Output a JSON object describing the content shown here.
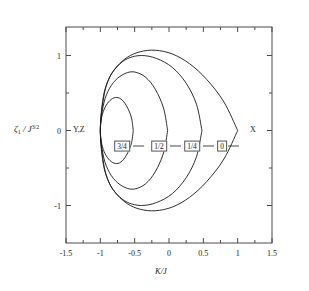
{
  "figure": {
    "background": "#ffffff",
    "axis_color": "#4d4d4d",
    "curve_color": "#1a1a1a"
  },
  "axes": {
    "x_title": "K/J",
    "y_title_zeta": "ζ",
    "y_title_sub": "1",
    "y_title_mid": " / J",
    "y_title_sup": "3/2",
    "x_ticks": [
      "-1.5",
      "-1",
      "-0.5",
      "0",
      "0.5",
      "1",
      "1.5"
    ],
    "x_tick_values": [
      -1.5,
      -1,
      -0.5,
      0,
      0.5,
      1,
      1.5
    ],
    "y_ticks": [
      "1",
      "0",
      "-1"
    ],
    "y_tick_values": [
      1,
      0,
      -1
    ],
    "x_minor_values": [
      -1.25,
      -0.75,
      -0.25,
      0.25,
      0.75,
      1.25
    ],
    "y_minor_values": [
      0.5,
      -0.5
    ],
    "xlim": [
      -1.5,
      1.5
    ],
    "ylim": [
      -1.5,
      1.38
    ]
  },
  "annotations": {
    "left_point": "Y,Z",
    "right_point": "X"
  },
  "curve_labels": [
    {
      "text": "3/4",
      "x_px": 122,
      "y_px": 146
    },
    {
      "text": "1/2",
      "x_px": 159,
      "y_px": 146
    },
    {
      "text": "1/4",
      "x_px": 192,
      "y_px": 146
    },
    {
      "text": "0",
      "x_px": 222,
      "y_px": 146
    }
  ],
  "chart_data": {
    "type": "line",
    "title": "",
    "xlabel": "K/J",
    "ylabel": "zeta_1 / J^(3/2)",
    "xlim": [
      -1.5,
      1.5
    ],
    "ylim": [
      -1.5,
      1.38
    ],
    "grid": false,
    "legend": "inline-boxed-labels",
    "annotations": [
      {
        "label": "Y,Z",
        "x": -1.0,
        "y": 0.0,
        "note": "left convergence point of all curves"
      },
      {
        "label": "X",
        "x": 1.0,
        "y": 0.0,
        "note": "cusp vertex of outermost curve"
      }
    ],
    "series": [
      {
        "name": "0",
        "param": 0.0,
        "x": [
          1.0,
          0.8,
          0.55,
          0.3,
          0.05,
          -0.2,
          -0.42,
          -0.6,
          -0.75,
          -0.87,
          -0.95,
          -1.0,
          -0.95,
          -0.87,
          -0.75,
          -0.6,
          -0.42,
          -0.2,
          0.05,
          0.3,
          0.55,
          0.8,
          1.0
        ],
        "y": [
          0.0,
          0.38,
          0.68,
          0.89,
          1.02,
          1.07,
          1.05,
          0.98,
          0.86,
          0.7,
          0.45,
          0.0,
          -0.45,
          -0.7,
          -0.86,
          -0.98,
          -1.05,
          -1.07,
          -1.02,
          -0.89,
          -0.68,
          -0.38,
          0.0
        ]
      },
      {
        "name": "1/4",
        "param": 0.25,
        "x": [
          0.48,
          0.4,
          0.25,
          0.05,
          -0.18,
          -0.4,
          -0.6,
          -0.76,
          -0.88,
          -0.96,
          -1.0,
          -0.96,
          -0.88,
          -0.76,
          -0.6,
          -0.4,
          -0.18,
          0.05,
          0.25,
          0.4,
          0.48
        ],
        "y": [
          0.0,
          0.35,
          0.63,
          0.84,
          0.96,
          1.0,
          0.96,
          0.85,
          0.68,
          0.43,
          0.0,
          -0.43,
          -0.68,
          -0.85,
          -0.96,
          -1.0,
          -0.96,
          -0.84,
          -0.63,
          -0.35,
          0.0
        ]
      },
      {
        "name": "1/2",
        "param": 0.5,
        "x": [
          -0.02,
          -0.08,
          -0.2,
          -0.34,
          -0.5,
          -0.64,
          -0.78,
          -0.89,
          -0.96,
          -1.0,
          -0.96,
          -0.89,
          -0.78,
          -0.64,
          -0.5,
          -0.34,
          -0.2,
          -0.08,
          -0.02
        ],
        "y": [
          0.0,
          0.3,
          0.55,
          0.71,
          0.78,
          0.76,
          0.67,
          0.52,
          0.32,
          0.0,
          -0.32,
          -0.52,
          -0.67,
          -0.76,
          -0.78,
          -0.71,
          -0.55,
          -0.3,
          0.0
        ]
      },
      {
        "name": "3/4",
        "param": 0.75,
        "x": [
          -0.52,
          -0.55,
          -0.62,
          -0.7,
          -0.78,
          -0.86,
          -0.93,
          -0.98,
          -1.0,
          -0.98,
          -0.93,
          -0.86,
          -0.78,
          -0.7,
          -0.62,
          -0.55,
          -0.52
        ],
        "y": [
          0.0,
          0.18,
          0.33,
          0.42,
          0.44,
          0.4,
          0.31,
          0.18,
          0.0,
          -0.18,
          -0.31,
          -0.4,
          -0.44,
          -0.42,
          -0.33,
          -0.18,
          0.0
        ]
      }
    ]
  }
}
